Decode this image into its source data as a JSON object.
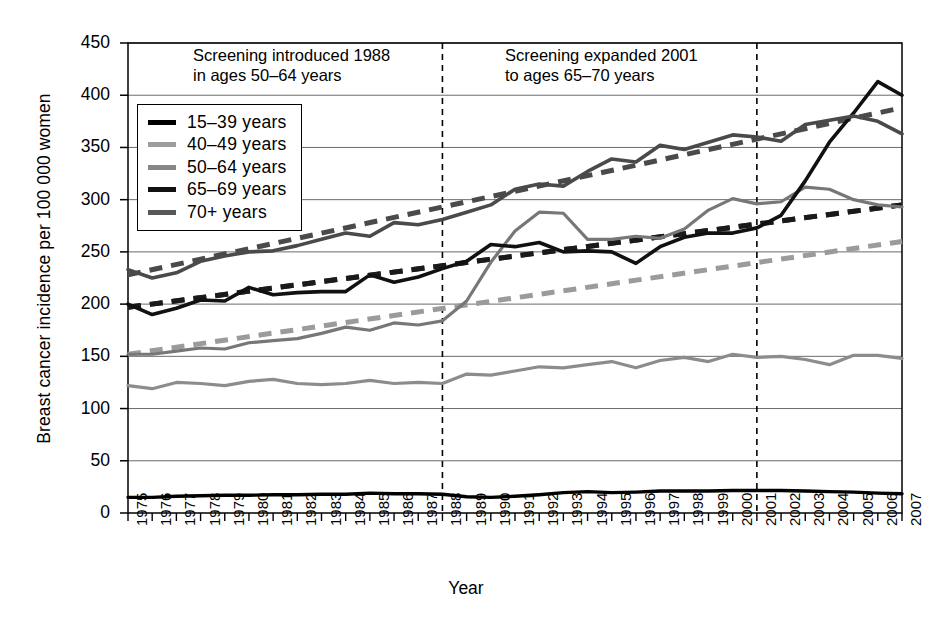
{
  "chart_data": {
    "type": "line",
    "title": "",
    "xlabel": "Year",
    "ylabel": "Breast cancer incidence per 100 000 women",
    "xlim": [
      1975,
      2007
    ],
    "ylim": [
      0,
      450
    ],
    "ytick_values": [
      0,
      50,
      100,
      150,
      200,
      250,
      300,
      350,
      400,
      450
    ],
    "ytick_labels": [
      "0",
      "50",
      "100",
      "150",
      "200",
      "250",
      "300",
      "350",
      "400",
      "450"
    ],
    "grid": "horizontal",
    "legend_position": "upper-left-inside",
    "x": [
      1975,
      1976,
      1977,
      1978,
      1979,
      1980,
      1981,
      1982,
      1983,
      1984,
      1985,
      1986,
      1987,
      1988,
      1989,
      1990,
      1991,
      1992,
      1993,
      1994,
      1995,
      1996,
      1997,
      1998,
      1999,
      2000,
      2001,
      2002,
      2003,
      2004,
      2005,
      2006,
      2007
    ],
    "xtick_labels": [
      "1975",
      "1976",
      "1977",
      "1978",
      "1979",
      "1980",
      "1981",
      "1982",
      "1983",
      "1984",
      "1985",
      "1986",
      "1987",
      "1988",
      "1989",
      "1990",
      "1991",
      "1992",
      "1993",
      "1994",
      "1995",
      "1996",
      "1997",
      "1998",
      "1999",
      "2000",
      "2001",
      "2002",
      "2003",
      "2004",
      "2005",
      "2006",
      "2007"
    ],
    "series": [
      {
        "name": "15-39 years",
        "color": "#000000",
        "width": 3.4,
        "style": "solid",
        "values": [
          15,
          15,
          16,
          16.5,
          17,
          17,
          17.5,
          17.5,
          18,
          18,
          19,
          18.5,
          18.5,
          18,
          15.5,
          15,
          16,
          17.5,
          19.5,
          20.5,
          19.5,
          20,
          21,
          21,
          21,
          21.5,
          21.5,
          21.5,
          21,
          20.5,
          20,
          19,
          18.5
        ]
      },
      {
        "name": "40-49 years",
        "color": "#8c8c8c",
        "width": 3.2,
        "style": "solid",
        "values": [
          122,
          119,
          125,
          124,
          122,
          126,
          128,
          124,
          123,
          124,
          127,
          124,
          125,
          124,
          133,
          132,
          136,
          140,
          139,
          142,
          145,
          139,
          146,
          149,
          145,
          152,
          149,
          150,
          147,
          142,
          151,
          151,
          148
        ]
      },
      {
        "name": "50-64 years",
        "color": "#777777",
        "width": 3.2,
        "style": "solid",
        "values": [
          152,
          152,
          155,
          158,
          157,
          163,
          165,
          167,
          172,
          178,
          175,
          182,
          180,
          184,
          203,
          240,
          270,
          288,
          287,
          262,
          262,
          265,
          263,
          272,
          290,
          301,
          296,
          298,
          312,
          310,
          300,
          295,
          293
        ]
      },
      {
        "name": "65-69 years",
        "color": "#111111",
        "width": 3.6,
        "style": "solid",
        "values": [
          200,
          190,
          196,
          204,
          203,
          216,
          209,
          211,
          212,
          212,
          228,
          221,
          226,
          234,
          241,
          257,
          255,
          259,
          250,
          251,
          250,
          239,
          255,
          264,
          268,
          268,
          273,
          285,
          318,
          355,
          383,
          413,
          400
        ]
      },
      {
        "name": "70+ years",
        "color": "#4a4a4a",
        "width": 3.6,
        "style": "solid",
        "values": [
          233,
          225,
          230,
          241,
          246,
          250,
          251,
          256,
          262,
          268,
          265,
          278,
          276,
          281,
          288,
          295,
          310,
          315,
          313,
          327,
          339,
          336,
          352,
          348,
          355,
          362,
          360,
          356,
          372,
          376,
          380,
          375,
          363
        ]
      }
    ],
    "trend_lines": [
      {
        "name": "40-49 years trend",
        "color": "#9b9b9b",
        "width": 5,
        "style": "dashed",
        "x": [
          1975,
          2007
        ],
        "values": [
          152,
          260
        ]
      },
      {
        "name": "50-64 years trend",
        "color": "#3a3a3a",
        "width": 5,
        "style": "dashed",
        "x": [
          1975,
          2007
        ],
        "values": [
          197,
          295
        ]
      },
      {
        "name": "65-69 years trend",
        "color": "#1a1a1a",
        "width": 5,
        "style": "dashed",
        "x": [
          1975,
          2007
        ],
        "values": [
          197,
          295
        ]
      },
      {
        "name": "70+ years trend",
        "color": "#4a4a4a",
        "width": 5,
        "style": "dashed",
        "x": [
          1975,
          2007
        ],
        "values": [
          228,
          388
        ]
      }
    ],
    "vlines": [
      {
        "name": "screening-introduced-1988",
        "x": 1988,
        "style": "dashed",
        "color": "#000000"
      },
      {
        "name": "screening-expanded-2001",
        "x": 2001,
        "style": "dashed",
        "color": "#000000"
      }
    ],
    "annotations": [
      {
        "name": "annotation-screening-introduced",
        "text": "Screening introduced 1988\nin ages 50–64 years"
      },
      {
        "name": "annotation-screening-expanded",
        "text": "Screening expanded 2001\nto ages 65–70 years"
      }
    ]
  },
  "legend": {
    "items": [
      {
        "label": "15–39 years",
        "color": "#000000"
      },
      {
        "label": "40–49 years",
        "color": "#9d9d9d"
      },
      {
        "label": "50–64 years",
        "color": "#878787"
      },
      {
        "label": "65–69 years",
        "color": "#111111"
      },
      {
        "label": "70+ years",
        "color": "#575757"
      }
    ]
  }
}
